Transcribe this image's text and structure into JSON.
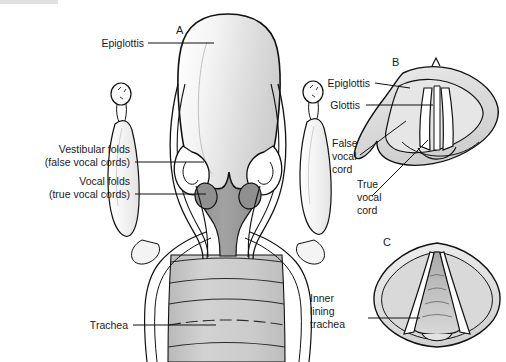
{
  "figure": {
    "title_visible": false,
    "panels": [
      {
        "id": "A",
        "name": "coronal-section-larynx"
      },
      {
        "id": "B",
        "name": "laryngoscopic-view-closed"
      },
      {
        "id": "C",
        "name": "laryngoscopic-view-open"
      }
    ]
  },
  "panel_a": {
    "id": "A",
    "labels": {
      "epiglottis": "Epiglottis",
      "vestibular_folds_line1": "Vestibular folds",
      "vestibular_folds_line2": "(false vocal cords)",
      "vocal_folds_line1": "Vocal folds",
      "vocal_folds_line2": "(true vocal cords)",
      "trachea": "Trachea"
    }
  },
  "panel_b": {
    "id": "B",
    "labels": {
      "epiglottis": "Epiglottis",
      "glottis": "Glottis",
      "false_vocal_cord_line1": "False",
      "false_vocal_cord_line2": "vocal",
      "false_vocal_cord_line3": "cord",
      "true_vocal_cord_line1": "True",
      "true_vocal_cord_line2": "vocal",
      "true_vocal_cord_line3": "cord"
    }
  },
  "panel_c": {
    "id": "C",
    "labels": {
      "inner_lining_line1": "Inner",
      "inner_lining_line2": "lining",
      "inner_lining_line3": "trachea"
    }
  },
  "colors": {
    "background": "#ffffff",
    "outline": "#111111",
    "text": "#1a1a1a",
    "epiglottis_light": "#f2f2f2",
    "epiglottis_mid": "#d8d8d8",
    "vestibule_gray": "#9b9b9b",
    "vestibule_dark": "#8a8a8a",
    "cartilage_white": "#fbfbfb",
    "trachea_gray": "#c9c9c9",
    "panel_gray": "#dcdcdc",
    "panel_light": "#ededed"
  }
}
